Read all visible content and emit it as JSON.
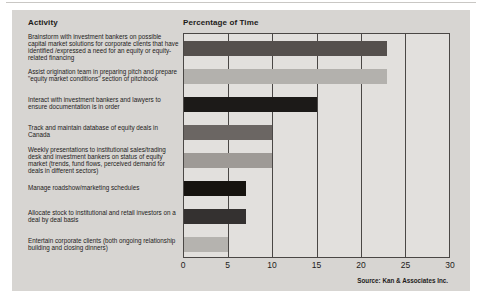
{
  "colors": {
    "panel_bg": "#d7d5d2",
    "plot_bg": "#e2e0dd",
    "grid_line": "#4a4745",
    "text": "#1d1b1a"
  },
  "chart_data": {
    "type": "bar",
    "orientation": "horizontal",
    "categories_axis_label": "Activity",
    "value_axis_label": "Percentage of Time",
    "categories": [
      "Brainstorm with investment bankers on possible capital market solutions for corporate clients that have identified /expressed a need for an equity or equity-related financing",
      "Assist origination team in preparing pitch and prepare \"equity market conditions\" section of pitchbook",
      "Interact with investment bankers and lawyers to ensure documentation is in order",
      "Track and maintain database of equity deals in Canada",
      "Weekly presentations to institutional sales/trading desk and investment bankers on status of equity market (trends, fund flows, perceived demand for deals in different sectors)",
      "Manage roadshow/marketing schedules",
      "Allocate stock to institutional and retail investors on a deal by deal basis",
      "Entertain corporate clients (both ongoing relationship building and closing dinners)"
    ],
    "values": [
      23,
      23,
      15,
      10,
      10,
      7,
      7,
      5
    ],
    "bar_colors": [
      "#55504d",
      "#b3b1ad",
      "#1c1a18",
      "#6b6663",
      "#9e9a96",
      "#16130f",
      "#343130",
      "#b5b3af"
    ],
    "xlim": [
      0,
      30
    ],
    "xticks": [
      0,
      5,
      10,
      15,
      20,
      25,
      30
    ],
    "grid": "vertical",
    "legend": "none",
    "source": "Source: Kan & Associates Inc."
  }
}
